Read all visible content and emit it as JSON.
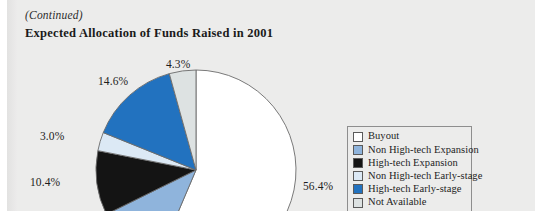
{
  "page": {
    "continued_note": "(Continued)",
    "background_color": "#ececeb"
  },
  "chart_data": {
    "type": "pie",
    "title": "Expected Allocation of Funds Raised in 2001",
    "subtitle": "",
    "xlabel": "",
    "ylabel": "",
    "legend_position": "right",
    "grid": false,
    "start_angle_deg": 0,
    "direction": "clockwise",
    "categories": [
      "Buyout",
      "Non High-tech Expansion",
      "High-tech Expansion",
      "Non High-tech Early-stage",
      "High-tech Early-stage",
      "Not Available"
    ],
    "values": [
      56.4,
      11.3,
      10.4,
      3.0,
      14.6,
      4.3
    ],
    "data_labels": [
      "56.4%",
      "",
      "10.4%",
      "3.0%",
      "14.6%",
      "4.3%"
    ],
    "colors": [
      "#ffffff",
      "#8fb4dc",
      "#141414",
      "#dce9f5",
      "#2272bf",
      "#dde2e2"
    ],
    "slice_edge_color": "#6b6b6b",
    "units": "percent"
  },
  "legend": {
    "items": [
      {
        "label": "Buyout",
        "color": "#ffffff"
      },
      {
        "label": "Non High-tech Expansion",
        "color": "#8fb4dc"
      },
      {
        "label": "High-tech Expansion",
        "color": "#141414"
      },
      {
        "label": "Non High-tech Early-stage",
        "color": "#dce9f5"
      },
      {
        "label": "High-tech Early-stage",
        "color": "#2272bf"
      },
      {
        "label": "Not Available",
        "color": "#dde2e2"
      }
    ]
  },
  "labels": {
    "pct_top_gray": "4.3%",
    "pct_blue": "14.6%",
    "pct_lightblue": "3.0%",
    "pct_black": "10.4%",
    "pct_white": "56.4%"
  }
}
